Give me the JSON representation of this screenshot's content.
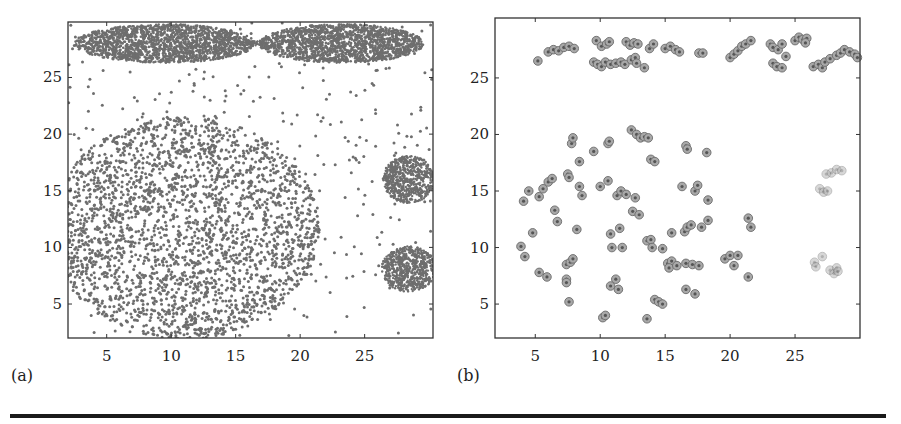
{
  "figure": {
    "rule_color": "#1a1a1a",
    "point_color": "#6e6e6e"
  },
  "chart_data": [
    {
      "id": "a",
      "panel_label": "(a)",
      "type": "scatter",
      "title": "",
      "xlabel": "",
      "ylabel": "",
      "xlim": [
        2,
        30.3
      ],
      "ylim": [
        2,
        29.9
      ],
      "xticks": [
        5,
        10,
        15,
        20,
        25
      ],
      "yticks": [
        5,
        10,
        15,
        20,
        25
      ],
      "grid": false,
      "legend": null,
      "frame_px": {
        "x0": 68,
        "x1": 433,
        "y0": 22,
        "y1": 338
      },
      "description": "Dense 2D point cloud: two elongated ellipses joined by a thin bridge at top, a large uniform disk lower-left, two small dense disks on the right, and sparse uniform background noise.",
      "clusters": [
        {
          "name": "top-left-ellipse",
          "shape": "ellipse",
          "cx": 9.5,
          "cy": 28.0,
          "rx": 7.0,
          "ry": 1.7,
          "n": 1800,
          "size": 1.3
        },
        {
          "name": "top-right-ellipse",
          "shape": "ellipse",
          "cx": 23.2,
          "cy": 28.0,
          "rx": 6.4,
          "ry": 1.7,
          "n": 1700,
          "size": 1.3
        },
        {
          "name": "bridge",
          "shape": "ellipse",
          "cx": 16.3,
          "cy": 28.0,
          "rx": 1.4,
          "ry": 0.22,
          "n": 60,
          "size": 1.0
        },
        {
          "name": "large-disk",
          "shape": "ellipse",
          "cx": 11.0,
          "cy": 11.7,
          "rx": 10.5,
          "ry": 9.8,
          "n": 2600,
          "size": 1.5
        },
        {
          "name": "right-disk-upper",
          "shape": "ellipse",
          "cx": 28.4,
          "cy": 16.0,
          "rx": 2.0,
          "ry": 2.1,
          "n": 700,
          "size": 1.2
        },
        {
          "name": "right-disk-lower",
          "shape": "ellipse",
          "cx": 28.4,
          "cy": 8.1,
          "rx": 2.1,
          "ry": 2.0,
          "n": 700,
          "size": 1.2
        },
        {
          "name": "background-noise",
          "shape": "rect",
          "cx": 16.15,
          "cy": 15.95,
          "rx": 14.1,
          "ry": 13.9,
          "n": 420,
          "size": 1.5
        }
      ]
    },
    {
      "id": "b",
      "panel_label": "(b)",
      "type": "scatter",
      "title": "",
      "xlabel": "",
      "ylabel": "",
      "xlim": [
        1.9,
        30.0
      ],
      "ylim": [
        2.0,
        30.3
      ],
      "xticks": [
        5,
        10,
        15,
        20,
        25
      ],
      "yticks": [
        5,
        10,
        15,
        20,
        25
      ],
      "grid": false,
      "legend": null,
      "frame_px": {
        "x0": 495,
        "x1": 860,
        "y0": 18,
        "y1": 338
      },
      "description": "Sparse representative points (circled markers) summarizing panel (a). Lighter markers at right correspond to the two small right-side clusters.",
      "marker": "circled-dot",
      "points": [
        {
          "x": 5.2,
          "y": 26.5
        },
        {
          "x": 6.0,
          "y": 27.3
        },
        {
          "x": 6.4,
          "y": 27.5
        },
        {
          "x": 6.8,
          "y": 27.4
        },
        {
          "x": 7.2,
          "y": 27.7
        },
        {
          "x": 7.6,
          "y": 27.8
        },
        {
          "x": 8.0,
          "y": 27.6
        },
        {
          "x": 9.7,
          "y": 28.3
        },
        {
          "x": 10.1,
          "y": 27.8
        },
        {
          "x": 10.5,
          "y": 28.0
        },
        {
          "x": 10.7,
          "y": 28.2
        },
        {
          "x": 12.0,
          "y": 28.2
        },
        {
          "x": 12.3,
          "y": 27.9
        },
        {
          "x": 12.6,
          "y": 28.1
        },
        {
          "x": 12.9,
          "y": 28.0
        },
        {
          "x": 13.8,
          "y": 27.6
        },
        {
          "x": 14.1,
          "y": 28.0
        },
        {
          "x": 15.0,
          "y": 27.6
        },
        {
          "x": 15.4,
          "y": 27.8
        },
        {
          "x": 15.8,
          "y": 27.5
        },
        {
          "x": 16.1,
          "y": 27.3
        },
        {
          "x": 9.5,
          "y": 26.4
        },
        {
          "x": 9.8,
          "y": 26.2
        },
        {
          "x": 10.1,
          "y": 26.0
        },
        {
          "x": 10.4,
          "y": 26.4
        },
        {
          "x": 10.8,
          "y": 26.2
        },
        {
          "x": 11.2,
          "y": 26.3
        },
        {
          "x": 11.6,
          "y": 26.4
        },
        {
          "x": 11.9,
          "y": 26.2
        },
        {
          "x": 12.4,
          "y": 26.6
        },
        {
          "x": 12.7,
          "y": 26.8
        },
        {
          "x": 12.8,
          "y": 26.3
        },
        {
          "x": 13.4,
          "y": 25.9
        },
        {
          "x": 17.6,
          "y": 27.2
        },
        {
          "x": 17.9,
          "y": 27.2
        },
        {
          "x": 20.0,
          "y": 26.8
        },
        {
          "x": 20.3,
          "y": 27.1
        },
        {
          "x": 20.6,
          "y": 27.4
        },
        {
          "x": 20.9,
          "y": 27.8
        },
        {
          "x": 21.2,
          "y": 28.0
        },
        {
          "x": 21.6,
          "y": 28.3
        },
        {
          "x": 23.1,
          "y": 28.0
        },
        {
          "x": 23.3,
          "y": 27.7
        },
        {
          "x": 23.7,
          "y": 27.5
        },
        {
          "x": 24.0,
          "y": 28.0
        },
        {
          "x": 24.3,
          "y": 26.9
        },
        {
          "x": 23.3,
          "y": 26.3
        },
        {
          "x": 23.6,
          "y": 26.0
        },
        {
          "x": 24.0,
          "y": 25.9
        },
        {
          "x": 25.0,
          "y": 28.3
        },
        {
          "x": 25.3,
          "y": 28.6
        },
        {
          "x": 25.6,
          "y": 28.4
        },
        {
          "x": 25.9,
          "y": 28.5
        },
        {
          "x": 25.8,
          "y": 28.1
        },
        {
          "x": 26.4,
          "y": 26.0
        },
        {
          "x": 26.8,
          "y": 26.2
        },
        {
          "x": 27.1,
          "y": 25.9
        },
        {
          "x": 27.3,
          "y": 26.4
        },
        {
          "x": 27.7,
          "y": 26.7
        },
        {
          "x": 28.2,
          "y": 27.0
        },
        {
          "x": 28.5,
          "y": 27.2
        },
        {
          "x": 28.8,
          "y": 27.5
        },
        {
          "x": 29.2,
          "y": 27.3
        },
        {
          "x": 29.6,
          "y": 27.1
        },
        {
          "x": 29.8,
          "y": 26.8
        },
        {
          "x": 4.1,
          "y": 14.1
        },
        {
          "x": 4.5,
          "y": 15.0
        },
        {
          "x": 5.3,
          "y": 14.5
        },
        {
          "x": 5.6,
          "y": 15.2
        },
        {
          "x": 6.0,
          "y": 15.8
        },
        {
          "x": 6.3,
          "y": 16.1
        },
        {
          "x": 6.5,
          "y": 13.3
        },
        {
          "x": 6.7,
          "y": 12.3
        },
        {
          "x": 7.5,
          "y": 16.5
        },
        {
          "x": 7.6,
          "y": 16.2
        },
        {
          "x": 7.8,
          "y": 19.2
        },
        {
          "x": 7.9,
          "y": 19.7
        },
        {
          "x": 8.4,
          "y": 17.6
        },
        {
          "x": 8.4,
          "y": 15.4
        },
        {
          "x": 8.6,
          "y": 14.6
        },
        {
          "x": 9.5,
          "y": 18.5
        },
        {
          "x": 10.0,
          "y": 15.4
        },
        {
          "x": 10.6,
          "y": 15.9
        },
        {
          "x": 10.6,
          "y": 19.2
        },
        {
          "x": 10.7,
          "y": 19.4
        },
        {
          "x": 11.3,
          "y": 14.6
        },
        {
          "x": 11.6,
          "y": 15.0
        },
        {
          "x": 12.0,
          "y": 14.7
        },
        {
          "x": 12.7,
          "y": 14.4
        },
        {
          "x": 12.5,
          "y": 13.2
        },
        {
          "x": 13.0,
          "y": 12.9
        },
        {
          "x": 12.4,
          "y": 20.4
        },
        {
          "x": 12.8,
          "y": 20.0
        },
        {
          "x": 13.1,
          "y": 19.7
        },
        {
          "x": 13.4,
          "y": 19.8
        },
        {
          "x": 13.7,
          "y": 19.7
        },
        {
          "x": 13.9,
          "y": 17.8
        },
        {
          "x": 14.2,
          "y": 17.6
        },
        {
          "x": 16.6,
          "y": 19.0
        },
        {
          "x": 16.7,
          "y": 18.7
        },
        {
          "x": 18.2,
          "y": 18.4
        },
        {
          "x": 16.3,
          "y": 15.4
        },
        {
          "x": 17.3,
          "y": 15.0
        },
        {
          "x": 17.5,
          "y": 15.5
        },
        {
          "x": 18.3,
          "y": 14.2
        },
        {
          "x": 3.9,
          "y": 10.1
        },
        {
          "x": 4.2,
          "y": 9.2
        },
        {
          "x": 4.8,
          "y": 11.3
        },
        {
          "x": 5.3,
          "y": 7.8
        },
        {
          "x": 5.9,
          "y": 7.4
        },
        {
          "x": 7.4,
          "y": 8.5
        },
        {
          "x": 7.7,
          "y": 8.7
        },
        {
          "x": 7.9,
          "y": 9.0
        },
        {
          "x": 7.4,
          "y": 7.2
        },
        {
          "x": 7.4,
          "y": 6.9
        },
        {
          "x": 7.6,
          "y": 5.2
        },
        {
          "x": 8.2,
          "y": 11.6
        },
        {
          "x": 10.2,
          "y": 3.8
        },
        {
          "x": 10.4,
          "y": 4.0
        },
        {
          "x": 10.8,
          "y": 11.2
        },
        {
          "x": 10.9,
          "y": 10.0
        },
        {
          "x": 11.5,
          "y": 11.7
        },
        {
          "x": 11.7,
          "y": 10.0
        },
        {
          "x": 10.8,
          "y": 6.6
        },
        {
          "x": 11.2,
          "y": 7.2
        },
        {
          "x": 11.4,
          "y": 6.3
        },
        {
          "x": 13.6,
          "y": 3.7
        },
        {
          "x": 14.2,
          "y": 5.4
        },
        {
          "x": 14.5,
          "y": 5.2
        },
        {
          "x": 14.8,
          "y": 5.0
        },
        {
          "x": 13.6,
          "y": 10.6
        },
        {
          "x": 13.9,
          "y": 10.7
        },
        {
          "x": 14.0,
          "y": 10.0
        },
        {
          "x": 14.8,
          "y": 9.9
        },
        {
          "x": 15.2,
          "y": 8.6
        },
        {
          "x": 15.5,
          "y": 8.8
        },
        {
          "x": 15.3,
          "y": 8.2
        },
        {
          "x": 15.9,
          "y": 8.4
        },
        {
          "x": 15.5,
          "y": 11.3
        },
        {
          "x": 16.5,
          "y": 11.4
        },
        {
          "x": 16.7,
          "y": 11.8
        },
        {
          "x": 17.0,
          "y": 12.0
        },
        {
          "x": 17.8,
          "y": 11.8
        },
        {
          "x": 18.3,
          "y": 12.4
        },
        {
          "x": 16.6,
          "y": 8.6
        },
        {
          "x": 17.1,
          "y": 8.5
        },
        {
          "x": 17.6,
          "y": 8.4
        },
        {
          "x": 16.6,
          "y": 6.3
        },
        {
          "x": 17.3,
          "y": 5.9
        },
        {
          "x": 19.6,
          "y": 9.0
        },
        {
          "x": 20.0,
          "y": 9.3
        },
        {
          "x": 20.3,
          "y": 8.4
        },
        {
          "x": 20.6,
          "y": 9.3
        },
        {
          "x": 21.4,
          "y": 12.6
        },
        {
          "x": 21.6,
          "y": 11.8
        },
        {
          "x": 21.4,
          "y": 7.4
        },
        {
          "x": 26.9,
          "y": 15.2,
          "light": true
        },
        {
          "x": 27.2,
          "y": 14.9,
          "light": true
        },
        {
          "x": 27.5,
          "y": 15.0,
          "light": true
        },
        {
          "x": 27.4,
          "y": 16.5,
          "light": true
        },
        {
          "x": 27.8,
          "y": 16.6,
          "light": true
        },
        {
          "x": 28.2,
          "y": 16.9,
          "light": true
        },
        {
          "x": 28.6,
          "y": 16.8,
          "light": true
        },
        {
          "x": 26.5,
          "y": 8.7,
          "light": true
        },
        {
          "x": 26.6,
          "y": 8.3,
          "light": true
        },
        {
          "x": 27.1,
          "y": 9.2,
          "light": true
        },
        {
          "x": 27.7,
          "y": 8.0,
          "light": true
        },
        {
          "x": 28.0,
          "y": 7.7,
          "light": true
        },
        {
          "x": 28.2,
          "y": 8.2,
          "light": true
        },
        {
          "x": 28.3,
          "y": 7.9,
          "light": true
        }
      ]
    }
  ]
}
